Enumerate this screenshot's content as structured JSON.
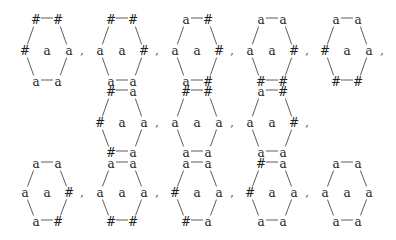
{
  "diagram": {
    "center_label": "a",
    "separator": ",",
    "rows": [
      {
        "hexagons": [
          {
            "top": [
              "#",
              "#"
            ],
            "mid": [
              "#",
              "a"
            ],
            "bottom": [
              "a",
              "a"
            ]
          },
          {
            "top": [
              "#",
              "#"
            ],
            "mid": [
              "a",
              "#"
            ],
            "bottom": [
              "a",
              "a"
            ]
          },
          {
            "top": [
              "a",
              "#"
            ],
            "mid": [
              "a",
              "#"
            ],
            "bottom": [
              "a",
              "#"
            ]
          },
          {
            "top": [
              "a",
              "a"
            ],
            "mid": [
              "a",
              "#"
            ],
            "bottom": [
              "#",
              "#"
            ]
          },
          {
            "top": [
              "a",
              "a"
            ],
            "mid": [
              "#",
              "a"
            ],
            "bottom": [
              "#",
              "#"
            ]
          }
        ]
      },
      {
        "hexagons": [
          {
            "top": [
              "#",
              "a"
            ],
            "mid": [
              "#",
              "a"
            ],
            "bottom": [
              "#",
              "a"
            ]
          },
          {
            "top": [
              "#",
              "#"
            ],
            "mid": [
              "a",
              "a"
            ],
            "bottom": [
              "a",
              "a"
            ]
          },
          {
            "top": [
              "a",
              "#"
            ],
            "mid": [
              "a",
              "#"
            ],
            "bottom": [
              "a",
              "a"
            ]
          }
        ]
      },
      {
        "hexagons": [
          {
            "top": [
              "a",
              "a"
            ],
            "mid": [
              "a",
              "#"
            ],
            "bottom": [
              "a",
              "#"
            ]
          },
          {
            "top": [
              "a",
              "a"
            ],
            "mid": [
              "a",
              "a"
            ],
            "bottom": [
              "#",
              "#"
            ]
          },
          {
            "top": [
              "a",
              "a"
            ],
            "mid": [
              "#",
              "a"
            ],
            "bottom": [
              "#",
              "a"
            ]
          },
          {
            "top": [
              "#",
              "a"
            ],
            "mid": [
              "#",
              "a"
            ],
            "bottom": [
              "a",
              "a"
            ]
          },
          {
            "top": [
              "a",
              "a"
            ],
            "mid": [
              "a",
              "a"
            ],
            "bottom": [
              "a",
              "a"
            ]
          }
        ]
      }
    ],
    "layout": {
      "rows": [
        {
          "centers_x": [
            47,
            122,
            197,
            272,
            347
          ],
          "y_top": 20,
          "y_mid": 51,
          "y_bottom": 82,
          "commas_after": [
            true,
            true,
            true,
            true,
            true
          ]
        },
        {
          "centers_x": [
            122,
            197,
            272
          ],
          "y_top": 92,
          "y_mid": 123,
          "y_bottom": 153,
          "commas_after": [
            true,
            true,
            true
          ]
        },
        {
          "centers_x": [
            47,
            122,
            197,
            272,
            347
          ],
          "y_top": 164,
          "y_mid": 193,
          "y_bottom": 222,
          "commas_after": [
            true,
            true,
            true,
            true,
            false
          ]
        }
      ],
      "half_top": 11,
      "half_mid": 22
    }
  }
}
